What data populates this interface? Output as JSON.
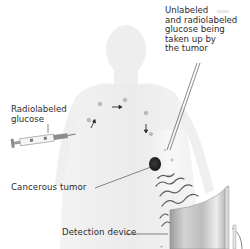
{
  "diagram": {
    "type": "PET scan illustration",
    "labels": {
      "unlabeled_glucose": {
        "lines": [
          "Unlabeled",
          "and radiolabeled",
          "glucose being",
          "taken up by",
          "the tumor"
        ]
      },
      "radiolabeled_glucose": {
        "lines": [
          "Radiolabeled",
          "glucose"
        ]
      },
      "cancerous_tumor": "Cancerous tumor",
      "detection_device": "Detection device"
    },
    "colors": {
      "body_silhouette": "#ececec",
      "text": "#2b2b2b",
      "leader_lines": "#3a3a3a",
      "tumor": "#1f1f1f",
      "radiation_waves": "#555555",
      "device_panel": "#c8c8c8",
      "legend_swatch": "#e6e8ee"
    },
    "elements": [
      "body-silhouette",
      "syringe",
      "glucose-molecules",
      "tumor",
      "radiation-waves",
      "detection-device"
    ]
  }
}
